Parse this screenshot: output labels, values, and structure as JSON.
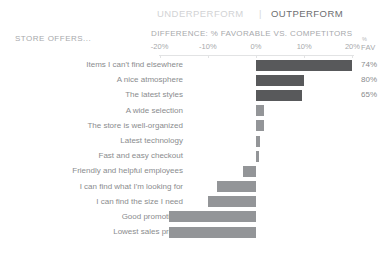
{
  "header": {
    "ghost_strip": "· · · ·",
    "underperform_label": "UNDERPERFORM",
    "separator": "|",
    "outperform_label": "OUTPERFORM",
    "row_group_caption": "STORE OFFERS...",
    "axis_caption": "DIFFERENCE: % FAVORABLE VS. COMPETITORS",
    "value_col_caption_top": "%",
    "value_col_caption_bottom": "FAV"
  },
  "colors": {
    "bar_neutral": "#939598",
    "bar_highlight": "#58595b",
    "text_muted": "#a7a9ac",
    "text_label": "#8a8c8e",
    "underperform_text": "#d2d3d5",
    "outperform_text": "#6d6e71",
    "axis_line": "#e2e3e4",
    "background": "#ffffff"
  },
  "chart_data": {
    "type": "bar",
    "title": "DIFFERENCE: % FAVORABLE VS. COMPETITORS",
    "subtitle": "STORE OFFERS...",
    "orientation": "horizontal",
    "diverging": true,
    "xlabel": "DIFFERENCE: % FAVORABLE VS. COMPETITORS",
    "ylabel": "",
    "xlim": [
      -25,
      25
    ],
    "xticks": [
      -20,
      -10,
      0,
      10,
      20
    ],
    "xticklabels": [
      "-20%",
      "-10%",
      "0%",
      "10%",
      "20%"
    ],
    "grid": false,
    "legend": [
      "UNDERPERFORM",
      "OUTPERFORM"
    ],
    "legend_position": "top",
    "value_column_header": "% FAV",
    "categories": [
      "Items I can't find elsewhere",
      "A nice atmosphere",
      "The latest styles",
      "A wide selection",
      "The store is well-organized",
      "Latest technology",
      "Fast and easy checkout",
      "Friendly and helpful employees",
      "I can find what I'm looking for",
      "I can find the size I need",
      "Good promotions",
      "Lowest sales prices"
    ],
    "values": [
      20.0,
      10.0,
      9.5,
      1.6,
      1.6,
      0.9,
      0.6,
      -2.6,
      -8.0,
      -10.0,
      -18.0,
      -18.0
    ],
    "fav_values": [
      "74%",
      "80%",
      "65%",
      "",
      "",
      "",
      "",
      "",
      "",
      "",
      "",
      ""
    ],
    "highlighted": [
      true,
      true,
      true,
      false,
      false,
      false,
      false,
      false,
      false,
      false,
      false,
      false
    ]
  }
}
